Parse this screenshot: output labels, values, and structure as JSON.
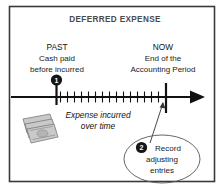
{
  "figure": {
    "title": "DEFERRED EXPENSE",
    "background_color": "#ffffff",
    "border_color": "#3a3a3a"
  },
  "left_label": {
    "heading": "PAST",
    "line1": "Cash paid",
    "line2": "before incurred"
  },
  "right_label": {
    "heading": "NOW",
    "line1": "End of the",
    "line2": "Accounting Period"
  },
  "timeline": {
    "axis_label_line1": "Expense incurred",
    "axis_label_line2": "over time",
    "tick_count": 15,
    "arrow_direction": "right",
    "axis_color": "#111111"
  },
  "markers": [
    {
      "id": "past-marker",
      "badge": "1",
      "position": "past"
    },
    {
      "id": "now-marker",
      "badge": "",
      "position": "now"
    }
  ],
  "callout": {
    "badge": "2",
    "line1": "Record",
    "line2": "adjusting",
    "line3": "entries"
  },
  "icons": {
    "cash": "money-bills-icon",
    "badge_one": "numbered-badge-1-icon",
    "badge_two": "numbered-badge-2-icon",
    "arrow": "arrow-right-icon"
  }
}
